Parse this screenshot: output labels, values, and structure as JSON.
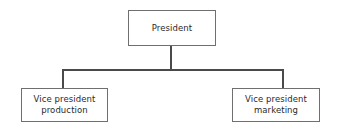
{
  "diagram": {
    "type": "organizational-chart",
    "background_color": "#ffffff",
    "line_color": "#4a4a4a",
    "box_border_color": "#6f6f6f",
    "text_color": "#2a2a2a",
    "nodes": [
      {
        "id": "president",
        "label": "President",
        "level": 0
      },
      {
        "id": "vp-production",
        "label": "Vice president\nproduction",
        "level": 1
      },
      {
        "id": "vp-marketing",
        "label": "Vice president\nmarketing",
        "level": 1
      }
    ],
    "connections": [
      {
        "from": "president",
        "to": "vp-production"
      },
      {
        "from": "president",
        "to": "vp-marketing"
      }
    ]
  }
}
